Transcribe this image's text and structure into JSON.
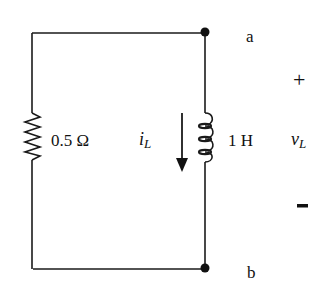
{
  "diagram": {
    "type": "circuit",
    "nodes": {
      "top": "a",
      "bottom": "b"
    },
    "resistor": {
      "value_label": "0.5 Ω"
    },
    "inductor": {
      "value_label": "1 H"
    },
    "current": {
      "symbol": "i",
      "subscript": "L",
      "direction": "down"
    },
    "voltage": {
      "symbol": "v",
      "subscript": "L",
      "plus": "+",
      "minus": "-"
    },
    "colors": {
      "wire": "#1a1a1a",
      "background": "#ffffff"
    }
  }
}
